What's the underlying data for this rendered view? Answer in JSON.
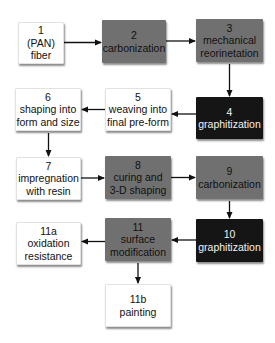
{
  "diagram": {
    "type": "process-flowchart",
    "colors": {
      "white_box": "#ffffff",
      "gray_box": "#707070",
      "black_box": "#151515",
      "arrow": "#111111"
    },
    "nodes": [
      {
        "id": "1",
        "number": "1",
        "label_lines": [
          "(PAN)",
          "fiber"
        ],
        "style": "white",
        "x": 18,
        "y": 22,
        "w": 46,
        "h": 42
      },
      {
        "id": "2",
        "number": "2",
        "label_lines": [
          "carbonization"
        ],
        "style": "gray",
        "x": 102,
        "y": 20,
        "w": 64,
        "h": 43
      },
      {
        "id": "3",
        "number": "3",
        "label_lines": [
          "mechanical",
          "reorinetation"
        ],
        "style": "gray",
        "x": 196,
        "y": 19,
        "w": 67,
        "h": 43
      },
      {
        "id": "4",
        "number": "4",
        "label_lines": [
          "graphitization"
        ],
        "style": "black",
        "x": 196,
        "y": 97,
        "w": 67,
        "h": 42
      },
      {
        "id": "5",
        "number": "5",
        "label_lines": [
          "weaving into",
          "final pre-form"
        ],
        "style": "white",
        "x": 105,
        "y": 88,
        "w": 66,
        "h": 43
      },
      {
        "id": "6",
        "number": "6",
        "label_lines": [
          "shaping into",
          "form and size"
        ],
        "style": "white",
        "x": 15,
        "y": 88,
        "w": 66,
        "h": 43
      },
      {
        "id": "7",
        "number": "7",
        "label_lines": [
          "impregnation",
          "with resin"
        ],
        "style": "white",
        "x": 16,
        "y": 157,
        "w": 65,
        "h": 43
      },
      {
        "id": "8",
        "number": "8",
        "label_lines": [
          "curing and",
          "3-D shaping"
        ],
        "style": "gray",
        "x": 105,
        "y": 156,
        "w": 66,
        "h": 43
      },
      {
        "id": "9",
        "number": "9",
        "label_lines": [
          "carbonization"
        ],
        "style": "gray",
        "x": 196,
        "y": 156,
        "w": 67,
        "h": 43
      },
      {
        "id": "10",
        "number": "10",
        "label_lines": [
          "graphitization"
        ],
        "style": "black",
        "x": 196,
        "y": 219,
        "w": 67,
        "h": 43
      },
      {
        "id": "11",
        "number": "11",
        "label_lines": [
          "surface",
          "modification"
        ],
        "style": "gray",
        "x": 105,
        "y": 218,
        "w": 66,
        "h": 43
      },
      {
        "id": "11a",
        "number": "11a",
        "label_lines": [
          "oxidation",
          "resistance"
        ],
        "style": "white",
        "x": 16,
        "y": 222,
        "w": 65,
        "h": 43
      },
      {
        "id": "11b",
        "number": "11b",
        "label_lines": [
          "painting"
        ],
        "style": "white",
        "x": 105,
        "y": 284,
        "w": 66,
        "h": 43
      }
    ],
    "edges": [
      {
        "from": "1",
        "to": "2"
      },
      {
        "from": "2",
        "to": "3"
      },
      {
        "from": "3",
        "to": "4"
      },
      {
        "from": "4",
        "to": "5"
      },
      {
        "from": "5",
        "to": "6"
      },
      {
        "from": "6",
        "to": "7"
      },
      {
        "from": "7",
        "to": "8"
      },
      {
        "from": "8",
        "to": "9"
      },
      {
        "from": "9",
        "to": "10"
      },
      {
        "from": "10",
        "to": "11"
      },
      {
        "from": "11",
        "to": "11a"
      },
      {
        "from": "11",
        "to": "11b"
      }
    ]
  }
}
